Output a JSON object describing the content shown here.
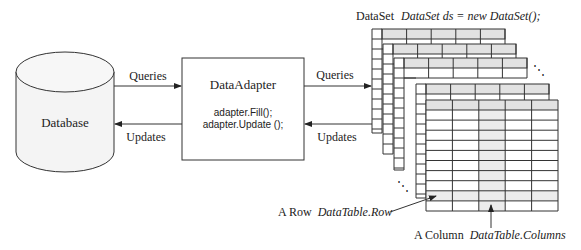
{
  "database": {
    "label": "Database"
  },
  "adapter": {
    "title": "DataAdapter",
    "line1": "adapter.Fill();",
    "line2": "adapter.Update ();"
  },
  "left_arrows": {
    "queries": "Queries",
    "updates": "Updates"
  },
  "right_arrows": {
    "queries": "Queries",
    "updates": "Updates"
  },
  "dataset": {
    "prefix": "DataSet",
    "code": "DataSet ds  = new DataSet();",
    "table_count": 5,
    "columns_per_table": 5,
    "ellipsis_top": "⋱",
    "ellipsis_bottom": "⋱"
  },
  "annotations": {
    "row_prefix": "A Row",
    "row_code": "DataTable.Row",
    "column_prefix": "A Column",
    "column_code": "DataTable.Columns"
  },
  "colors": {
    "line": "#333333",
    "header_fill": "#e2e2e2",
    "highlight_fill": "#ececec",
    "cylinder_fill": "#f4f4f4",
    "background": "#ffffff"
  }
}
